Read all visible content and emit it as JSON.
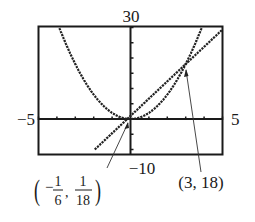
{
  "chart_data": {
    "type": "line",
    "title": "",
    "xlabel": "",
    "ylabel": "",
    "xlim": [
      -5,
      5
    ],
    "ylim": [
      -10,
      30
    ],
    "x_tick_step": 1,
    "y_tick_step": 5,
    "grid": false,
    "window_labels": {
      "xmin": "−5",
      "xmax": "5",
      "ymin": "−10",
      "ymax": "30"
    },
    "series": [
      {
        "name": "parabola",
        "equation": "y = 2x^2",
        "style": "dotted-thick"
      },
      {
        "name": "line",
        "equation": "y = (17/3)x + 1",
        "style": "dotted-thick"
      }
    ],
    "annotations": [
      {
        "point": [
          -0.1667,
          0.0556
        ],
        "label_text": "(−1/6, 1/18)",
        "label_parts": {
          "open": "(",
          "sign": "−",
          "n1": "1",
          "d1": "6",
          "comma": ",",
          "n2": "1",
          "d2": "18",
          "close": ")"
        }
      },
      {
        "point": [
          3,
          18
        ],
        "label_text": "(3, 18)"
      }
    ]
  }
}
